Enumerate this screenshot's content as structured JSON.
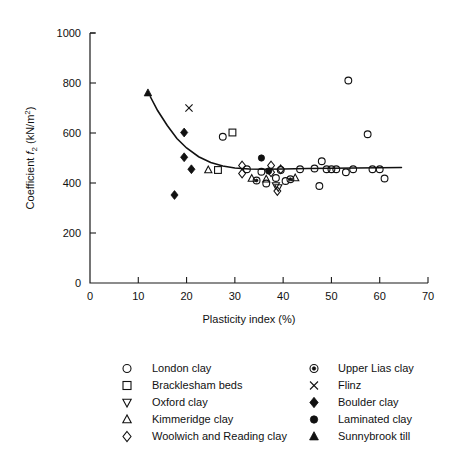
{
  "chart_data": {
    "type": "scatter",
    "title": "",
    "xlabel": "Plasticity index (%)",
    "ylabel": "Coefficient f2 (kN/m2)",
    "ylabel_parts": {
      "prefix": "Coefficient ",
      "symbol": "f",
      "sub": "2",
      "units_open": " (kN/m",
      "sup": "2",
      "units_close": ")"
    },
    "xlim": [
      0,
      70
    ],
    "ylim": [
      0,
      1000
    ],
    "xticks": [
      0,
      10,
      20,
      30,
      40,
      50,
      60,
      70
    ],
    "yticks": [
      0,
      200,
      400,
      600,
      800,
      1000
    ],
    "grid": false,
    "legend_position": "below-plot-two-columns",
    "trend_line": {
      "label": "fitted curve",
      "points": [
        [
          12.5,
          745
        ],
        [
          14,
          690
        ],
        [
          16,
          630
        ],
        [
          18,
          578
        ],
        [
          20,
          540
        ],
        [
          22.5,
          505
        ],
        [
          25,
          482
        ],
        [
          27.5,
          468
        ],
        [
          30,
          460
        ],
        [
          33,
          456
        ],
        [
          36,
          455
        ],
        [
          40,
          456
        ],
        [
          45,
          458
        ],
        [
          50,
          459
        ],
        [
          55,
          460
        ],
        [
          60,
          461
        ],
        [
          64.5,
          462
        ]
      ]
    },
    "series": [
      {
        "name": "London clay",
        "marker": "open-circle",
        "points": [
          [
            27.5,
            585
          ],
          [
            32.5,
            455
          ],
          [
            35.5,
            445
          ],
          [
            36.5,
            398
          ],
          [
            38.5,
            420
          ],
          [
            39.5,
            452
          ],
          [
            40.5,
            408
          ],
          [
            43.5,
            455
          ],
          [
            46.5,
            458
          ],
          [
            47.5,
            388
          ],
          [
            48,
            487
          ],
          [
            49,
            455
          ],
          [
            50,
            455
          ],
          [
            51,
            455
          ],
          [
            53.5,
            810
          ],
          [
            53,
            443
          ],
          [
            54.5,
            455
          ],
          [
            57.5,
            595
          ],
          [
            58.5,
            455
          ],
          [
            60,
            455
          ],
          [
            61,
            418
          ]
        ]
      },
      {
        "name": "Bracklesham beds",
        "marker": "open-square",
        "points": [
          [
            29.5,
            602
          ],
          [
            26.5,
            452
          ]
        ]
      },
      {
        "name": "Oxford clay",
        "marker": "open-down-triangle",
        "points": [
          [
            38.5,
            390
          ],
          [
            39,
            382
          ]
        ]
      },
      {
        "name": "Kimmeridge clay",
        "marker": "open-up-triangle",
        "points": [
          [
            24.5,
            452
          ],
          [
            33.5,
            418
          ],
          [
            36.5,
            415
          ],
          [
            42.5,
            420
          ]
        ]
      },
      {
        "name": "Woolwich and Reading clay",
        "marker": "open-diamond",
        "points": [
          [
            31.5,
            470
          ],
          [
            31.5,
            438
          ],
          [
            37.5,
            470
          ],
          [
            37.5,
            443
          ],
          [
            39.5,
            455
          ],
          [
            38.8,
            368
          ]
        ]
      },
      {
        "name": "Upper Lias clay",
        "marker": "dotted-circle",
        "points": [
          [
            34.5,
            410
          ],
          [
            41.5,
            415
          ]
        ]
      },
      {
        "name": "Flinz",
        "marker": "cross",
        "points": [
          [
            20.5,
            700
          ]
        ]
      },
      {
        "name": "Boulder clay",
        "marker": "filled-diamond",
        "points": [
          [
            19.5,
            602
          ],
          [
            19.5,
            503
          ],
          [
            21,
            455
          ],
          [
            17.5,
            352
          ]
        ]
      },
      {
        "name": "Laminated clay",
        "marker": "filled-circle",
        "points": [
          [
            35.5,
            500
          ],
          [
            37,
            448
          ]
        ]
      },
      {
        "name": "Sunnybrook till",
        "marker": "filled-triangle",
        "points": [
          [
            12,
            760
          ]
        ]
      }
    ],
    "legend": {
      "left_column": [
        {
          "label": "London clay",
          "marker": "open-circle"
        },
        {
          "label": "Bracklesham beds",
          "marker": "open-square"
        },
        {
          "label": "Oxford clay",
          "marker": "open-down-triangle"
        },
        {
          "label": "Kimmeridge clay",
          "marker": "open-up-triangle"
        },
        {
          "label": "Woolwich and Reading clay",
          "marker": "open-diamond"
        }
      ],
      "right_column": [
        {
          "label": "Upper Lias clay",
          "marker": "dotted-circle"
        },
        {
          "label": "Flinz",
          "marker": "cross"
        },
        {
          "label": "Boulder clay",
          "marker": "filled-diamond"
        },
        {
          "label": "Laminated clay",
          "marker": "filled-circle"
        },
        {
          "label": "Sunnybrook till",
          "marker": "filled-triangle"
        }
      ]
    },
    "colors": {
      "ink": "#111111",
      "background": "#ffffff"
    }
  }
}
